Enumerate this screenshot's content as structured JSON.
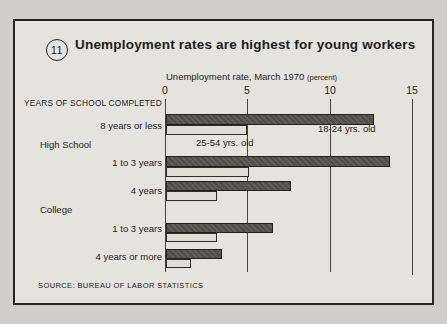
{
  "figure": {
    "number": "11",
    "source": "SOURCE: BUREAU OF LABOR STATISTICS"
  },
  "chart_data": {
    "type": "bar",
    "orientation": "horizontal",
    "title": "Unemployment rates are highest for young workers",
    "axis_title": "Unemployment rate, March 1970",
    "axis_unit": "(percent)",
    "xlim": [
      0,
      15
    ],
    "x_ticks": [
      "0",
      "5",
      "10",
      "15"
    ],
    "grid": "vertical gridlines at 0, 5, 10, 15",
    "column_header": "YEARS OF SCHOOL COMPLETED",
    "legend_style": "inline labels next to first bar pair",
    "series": [
      {
        "name": "18-24 yrs. old",
        "color": "#4e4d4a"
      },
      {
        "name": "25-54 yrs. old",
        "color": "#dedcd5"
      }
    ],
    "groups": [
      {
        "label": "High School"
      },
      {
        "label": "College"
      }
    ],
    "rows": [
      {
        "category": "8 years or less",
        "group": "",
        "values": [
          12.6,
          4.9
        ]
      },
      {
        "category": "1 to 3 years",
        "group": "High School",
        "values": [
          13.6,
          5.0
        ]
      },
      {
        "category": "4 years",
        "group": "High School",
        "values": [
          7.6,
          3.1
        ]
      },
      {
        "category": "1 to 3 years",
        "group": "College",
        "values": [
          6.5,
          3.1
        ]
      },
      {
        "category": "4 years or more",
        "group": "College",
        "values": [
          3.4,
          1.5
        ]
      }
    ]
  }
}
